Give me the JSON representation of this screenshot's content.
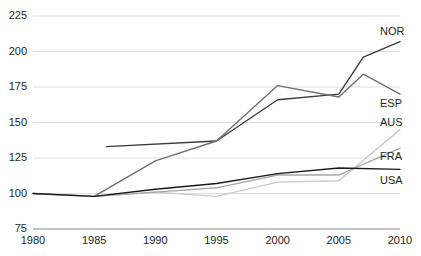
{
  "chart_data": {
    "type": "line",
    "title": "",
    "subtitle": "",
    "xlabel": "",
    "ylabel": "",
    "xlim": [
      1980,
      2010
    ],
    "ylim": [
      75,
      225
    ],
    "grid": true,
    "legend_position": "right-inline",
    "x_ticks": [
      "1980",
      "1985",
      "1990",
      "1995",
      "2000",
      "2005",
      "2010"
    ],
    "y_ticks": [
      "75",
      "100",
      "125",
      "150",
      "175",
      "200",
      "225"
    ],
    "series": [
      {
        "name": "NOR",
        "color": "#3b3b3b",
        "label": "NOR",
        "label_value": 207,
        "x": [
          1986,
          1995,
          2000,
          2005,
          2007,
          2010
        ],
        "values": [
          133,
          137,
          166,
          170,
          196,
          207
        ]
      },
      {
        "name": "ESP",
        "color": "#6f6f6f",
        "label": "ESP",
        "label_value": 170,
        "x": [
          1985,
          1990,
          1995,
          2000,
          2005,
          2007,
          2010
        ],
        "values": [
          98,
          123,
          137,
          176,
          168,
          184,
          170
        ]
      },
      {
        "name": "AUS",
        "color": "#c9c9c9",
        "label": "AUS",
        "label_value": 145,
        "x": [
          1980,
          1985,
          1990,
          1995,
          2000,
          2005,
          2010
        ],
        "values": [
          100,
          98,
          101,
          98,
          108,
          109,
          145
        ]
      },
      {
        "name": "FRA",
        "color": "#a8a8a8",
        "label": "FRA",
        "label_value": 132,
        "x": [
          1980,
          1985,
          1990,
          1995,
          2000,
          2005,
          2010
        ],
        "values": [
          100,
          98,
          101,
          104,
          113,
          113,
          132
        ]
      },
      {
        "name": "USA",
        "color": "#1a1a1a",
        "label": "USA",
        "label_value": 117,
        "x": [
          1980,
          1985,
          1990,
          1995,
          2000,
          2005,
          2010
        ],
        "values": [
          100,
          98,
          103,
          107,
          114,
          118,
          117
        ]
      }
    ]
  }
}
